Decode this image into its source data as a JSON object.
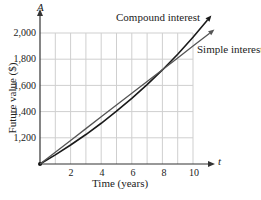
{
  "chart_data": {
    "type": "line",
    "title": "",
    "xlabel": "Time (years)",
    "ylabel": "Future value ($)",
    "x_axis_symbol": "t",
    "y_axis_symbol": "A",
    "xlim": [
      0,
      11.4
    ],
    "ylim": [
      1000,
      2150
    ],
    "x_ticks": [
      2,
      4,
      6,
      8,
      10
    ],
    "x_tick_labels": [
      "2",
      "4",
      "6",
      "8",
      "10"
    ],
    "y_ticks": [
      1200,
      1400,
      1600,
      1800,
      2000
    ],
    "y_tick_labels": [
      "1,200",
      "1,400",
      "1,600",
      "1,800",
      "2,000"
    ],
    "grid": true,
    "grid_x_step": 1,
    "grid_y_step": 200,
    "legend": "inline labels",
    "series": [
      {
        "name": "Compound interest",
        "color": "#1a1a1a",
        "x": [
          0,
          1,
          2,
          3,
          4,
          5,
          6,
          7,
          8,
          9,
          10,
          11.2
        ],
        "values": [
          1000,
          1070,
          1145,
          1225,
          1311,
          1403,
          1501,
          1606,
          1718,
          1838,
          1967,
          2134
        ]
      },
      {
        "name": "Simple interest",
        "color": "#555555",
        "x": [
          0,
          1,
          2,
          3,
          4,
          5,
          6,
          7,
          8,
          9,
          10,
          11.4
        ],
        "values": [
          1000,
          1090,
          1180,
          1270,
          1360,
          1450,
          1540,
          1630,
          1720,
          1810,
          1900,
          2026
        ]
      }
    ],
    "annotations": [
      "Compound interest",
      "Simple interest"
    ]
  },
  "labels": {
    "y_axis_symbol": "A",
    "x_axis_symbol": "t",
    "ylabel": "Future value ($)",
    "xlabel": "Time (years)",
    "compound": "Compound interest",
    "simple": "Simple interest",
    "y_ticks": [
      "2,000",
      "1,800",
      "1,600",
      "1,400",
      "1,200"
    ],
    "x_ticks": [
      "2",
      "4",
      "6",
      "8",
      "10"
    ]
  },
  "colors": {
    "grid": "#cfcfcf",
    "axis": "#333333",
    "compound": "#1a1a1a",
    "simple": "#555555"
  }
}
